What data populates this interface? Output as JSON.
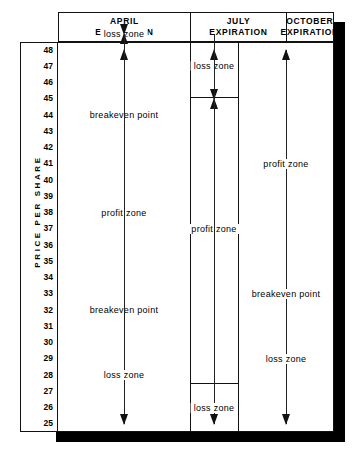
{
  "figure": {
    "axis_title": "PRICE PER SHARE",
    "price_ticks": [
      48,
      47,
      46,
      45,
      44,
      43,
      42,
      41,
      40,
      39,
      38,
      37,
      36,
      35,
      34,
      33,
      32,
      31,
      30,
      29,
      28,
      27,
      26,
      25
    ],
    "columns": [
      {
        "id": "april",
        "title_line1": "APRIL",
        "title_line2": "EXPIRATION",
        "zones": [
          {
            "id": "april-loss-upper",
            "label": "loss zone",
            "direction": "up"
          },
          {
            "id": "april-breakeven-upper",
            "label": "breakeven point"
          },
          {
            "id": "april-profit",
            "label": "profit zone",
            "direction": "both"
          },
          {
            "id": "april-breakeven-lower",
            "label": "breakeven point"
          },
          {
            "id": "april-loss-lower",
            "label": "loss zone",
            "direction": "down"
          }
        ]
      },
      {
        "id": "july",
        "title_line1": "JULY",
        "title_line2": "EXPIRATION",
        "zones": [
          {
            "id": "july-loss-upper",
            "label": "loss zone",
            "direction": "up"
          },
          {
            "id": "july-profit",
            "label": "profit zone",
            "direction": "both"
          },
          {
            "id": "july-loss-lower",
            "label": "loss zone",
            "direction": "down"
          }
        ]
      },
      {
        "id": "october",
        "title_line1": "OCTOBER",
        "title_line2": "EXPIRATION",
        "zones": [
          {
            "id": "october-profit",
            "label": "profit zone",
            "direction": "up"
          },
          {
            "id": "october-breakeven",
            "label": "breakeven point"
          },
          {
            "id": "october-loss",
            "label": "loss zone",
            "direction": "down"
          }
        ]
      }
    ]
  },
  "chart_data": {
    "type": "table",
    "ylabel": "PRICE PER SHARE",
    "ylim": [
      25,
      48
    ],
    "grid": false,
    "legend": "none",
    "categories": [
      "APRIL EXPIRATION",
      "JULY EXPIRATION",
      "OCTOBER EXPIRATION"
    ],
    "series": [
      {
        "name": "APRIL EXPIRATION",
        "zones": [
          {
            "label": "loss zone",
            "from": 44,
            "to": 48,
            "arrow": "up"
          },
          {
            "label": "breakeven point",
            "at": 44
          },
          {
            "label": "profit zone",
            "from": 32,
            "to": 44,
            "arrow": "both"
          },
          {
            "label": "breakeven point",
            "at": 32
          },
          {
            "label": "loss zone",
            "from": 25,
            "to": 32,
            "arrow": "down"
          }
        ]
      },
      {
        "name": "JULY EXPIRATION",
        "zones": [
          {
            "label": "loss zone",
            "from": 45,
            "to": 48,
            "arrow": "up"
          },
          {
            "label": "profit zone",
            "from": 28,
            "to": 45,
            "arrow": "both"
          },
          {
            "label": "loss zone",
            "from": 25,
            "to": 28,
            "arrow": "down"
          }
        ]
      },
      {
        "name": "OCTOBER EXPIRATION",
        "zones": [
          {
            "label": "profit zone",
            "from": 33,
            "to": 48,
            "arrow": "up"
          },
          {
            "label": "breakeven point",
            "at": 33
          },
          {
            "label": "loss zone",
            "from": 25,
            "to": 33,
            "arrow": "down"
          }
        ]
      }
    ]
  }
}
